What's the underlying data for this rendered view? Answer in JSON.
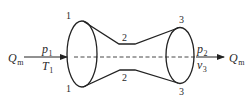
{
  "diagram": {
    "type": "converging-diverging nozzle (flow channel)",
    "stroke_color": "#222222",
    "sections": [
      {
        "id": "1",
        "label_top": "1",
        "label_bottom": "1"
      },
      {
        "id": "2",
        "label_top": "2",
        "label_bottom": "2"
      },
      {
        "id": "3",
        "label_top": "3",
        "label_bottom": "3"
      }
    ],
    "inlet": {
      "flow_symbol": "Q",
      "flow_sub": "m",
      "pressure_symbol": "p",
      "pressure_sub": "1",
      "temperature_symbol": "T",
      "temperature_sub": "1"
    },
    "outlet": {
      "flow_symbol": "Q",
      "flow_sub": "m",
      "pressure_symbol": "p",
      "pressure_sub": "2",
      "velocity_symbol": "v",
      "velocity_sub": "3"
    }
  }
}
